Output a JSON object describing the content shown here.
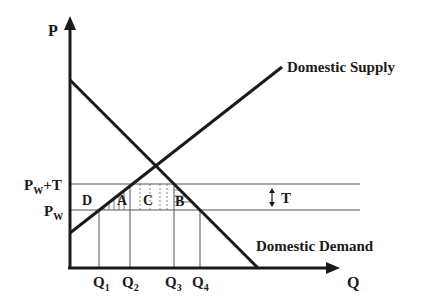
{
  "diagram": {
    "type": "tariff supply-demand diagram",
    "colors": {
      "ink": "#1a1a1a",
      "thin": "#555555",
      "background": "#ffffff"
    },
    "axes": {
      "y_label": "P",
      "x_label": "Q"
    },
    "curves": {
      "supply_label": "Domestic Supply",
      "demand_label": "Domestic Demand"
    },
    "price_levels": {
      "world_price_main": "P",
      "world_price_sub": "W",
      "tariff_price_main": "P",
      "tariff_price_sub": "W",
      "tariff_price_suffix": "+T"
    },
    "tariff_marker": {
      "arrow_glyph": "↕",
      "label": "T"
    },
    "areas": {
      "a": "A",
      "b": "B",
      "c": "C",
      "d": "D"
    },
    "quantities": [
      {
        "main": "Q",
        "sub": "1"
      },
      {
        "main": "Q",
        "sub": "2"
      },
      {
        "main": "Q",
        "sub": "3"
      },
      {
        "main": "Q",
        "sub": "4"
      }
    ]
  }
}
